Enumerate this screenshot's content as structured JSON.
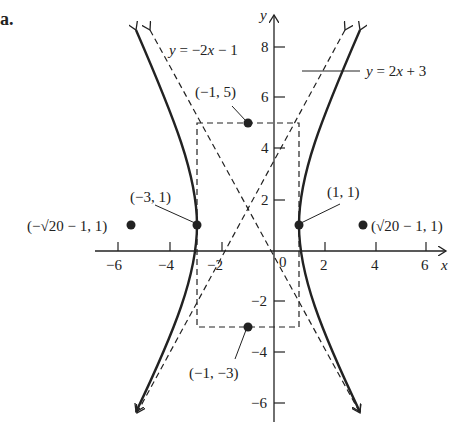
{
  "figure": {
    "label": "a.",
    "axes": {
      "x_label": "x",
      "y_label": "y",
      "x_ticks": [
        "−6",
        "−4",
        "−2",
        "0",
        "2",
        "4",
        "6"
      ],
      "y_ticks": [
        "8",
        "6",
        "4",
        "2",
        "−2",
        "−4",
        "−6"
      ]
    },
    "asymptotes": [
      {
        "label": "y = −2x − 1"
      },
      {
        "label": "y = 2x + 3"
      }
    ],
    "points": [
      {
        "label": "(−1, 5)"
      },
      {
        "label": "(−3, 1)"
      },
      {
        "label": "(1, 1)"
      },
      {
        "label": "(−1, −3)"
      },
      {
        "label": "(−√20 − 1, 1)"
      },
      {
        "label": "(√20 − 1, 1)"
      }
    ]
  }
}
